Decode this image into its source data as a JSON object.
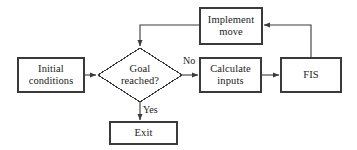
{
  "diagram": {
    "type": "flowchart",
    "canvas": {
      "width": 357,
      "height": 150
    },
    "style": {
      "background_color": "#ffffff",
      "stroke_color": "#3a3a3a",
      "text_color": "#1a1a1a",
      "node_fill": "#ffffff",
      "stroke_width": 1.1
    },
    "nodes": [
      {
        "id": "initial-conditions",
        "shape": "rectangle",
        "label": "Initial\nconditions",
        "x": 18,
        "y": 58,
        "width": 66,
        "height": 34
      },
      {
        "id": "goal-reached",
        "shape": "diamond",
        "label": "Goal\nreached?",
        "x": 98,
        "y": 48,
        "width": 84,
        "height": 54
      },
      {
        "id": "calculate-inputs",
        "shape": "rectangle",
        "label": "Calculate\ninputs",
        "x": 200,
        "y": 58,
        "width": 61,
        "height": 34
      },
      {
        "id": "fis",
        "shape": "rectangle",
        "label": "FIS",
        "x": 281,
        "y": 58,
        "width": 60,
        "height": 34
      },
      {
        "id": "implement-move",
        "shape": "rectangle",
        "label": "Implement\nmove",
        "x": 200,
        "y": 8,
        "width": 62,
        "height": 36
      },
      {
        "id": "exit",
        "shape": "rectangle",
        "label": "Exit",
        "x": 110,
        "y": 122,
        "width": 67,
        "height": 22
      }
    ],
    "edges": [
      {
        "id": "initial-to-goal",
        "from": "initial-conditions",
        "to": "goal-reached",
        "label": ""
      },
      {
        "id": "goal-to-calculate",
        "from": "goal-reached",
        "to": "calculate-inputs",
        "label": "No"
      },
      {
        "id": "goal-to-exit",
        "from": "goal-reached",
        "to": "exit",
        "label": "Yes"
      },
      {
        "id": "calculate-to-fis",
        "from": "calculate-inputs",
        "to": "fis",
        "label": ""
      },
      {
        "id": "fis-to-implement",
        "from": "fis",
        "to": "implement-move",
        "label": ""
      },
      {
        "id": "implement-to-goal",
        "from": "implement-move",
        "to": "goal-reached",
        "label": ""
      }
    ],
    "edge_labels": {
      "no": {
        "text": "No",
        "x": 183,
        "y": 56
      },
      "yes": {
        "text": "Yes",
        "x": 143,
        "y": 105
      }
    }
  }
}
